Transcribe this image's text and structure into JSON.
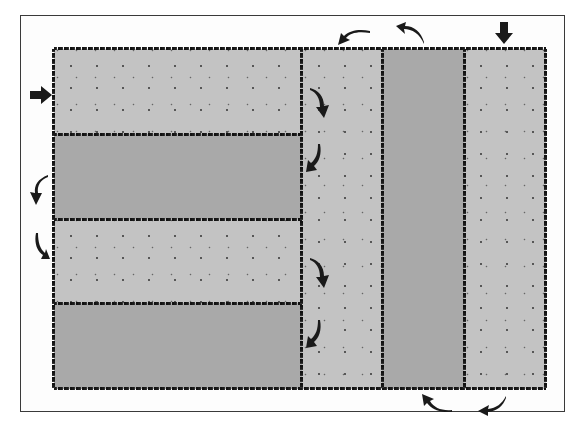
{
  "diagram": {
    "type": "field-plot layout with turning flow arrows",
    "colors": {
      "frame_border": "#3a3a3a",
      "background": "#fdfdfd",
      "light_strip": "#c3c3c3",
      "dark_strip": "#a9a9a9",
      "edges_and_arrows": "#1a1a1a"
    },
    "left_block": {
      "orientation": "horizontal strips",
      "strips": [
        {
          "index": 1,
          "shade": "light",
          "dotted": true
        },
        {
          "index": 2,
          "shade": "dark",
          "dotted": false
        },
        {
          "index": 3,
          "shade": "light",
          "dotted": true
        },
        {
          "index": 4,
          "shade": "dark",
          "dotted": false
        }
      ]
    },
    "right_block": {
      "orientation": "vertical strips",
      "strips": [
        {
          "index": 1,
          "shade": "light",
          "dotted": true
        },
        {
          "index": 2,
          "shade": "dark",
          "dotted": false
        },
        {
          "index": 3,
          "shade": "light",
          "dotted": true
        }
      ]
    },
    "arrows": [
      {
        "id": "entry-left",
        "kind": "straight",
        "direction": "right"
      },
      {
        "id": "entry-top",
        "kind": "straight",
        "direction": "down"
      },
      {
        "id": "turn-top-1",
        "kind": "curved",
        "direction": "left"
      },
      {
        "id": "turn-top-2",
        "kind": "curved",
        "direction": "left"
      },
      {
        "id": "turn-left-1",
        "kind": "curved",
        "direction": "down"
      },
      {
        "id": "turn-left-2",
        "kind": "curved",
        "direction": "down"
      },
      {
        "id": "turn-mid-1",
        "kind": "curved",
        "direction": "down"
      },
      {
        "id": "turn-mid-2",
        "kind": "curved",
        "direction": "down"
      },
      {
        "id": "turn-mid-3",
        "kind": "curved",
        "direction": "down"
      },
      {
        "id": "turn-mid-4",
        "kind": "curved",
        "direction": "down"
      },
      {
        "id": "turn-bottom-1",
        "kind": "curved",
        "direction": "left"
      },
      {
        "id": "turn-bottom-2",
        "kind": "curved",
        "direction": "up-left"
      }
    ]
  }
}
